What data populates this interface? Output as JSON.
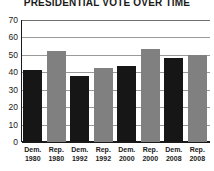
{
  "chart_data": {
    "type": "bar",
    "title": "PRESIDENTIAL VOTE OVER TIME",
    "subtitle": "",
    "xlabel": "",
    "ylabel": "",
    "ylim": [
      0,
      70
    ],
    "yticks": [
      0,
      10,
      20,
      30,
      40,
      50,
      60,
      70
    ],
    "grid": true,
    "legend": "none",
    "categories": [
      "Dem. 1980",
      "Rep. 1980",
      "Dem. 1992",
      "Rep. 1992",
      "Dem. 2000",
      "Rep. 2000",
      "Dem. 2008",
      "Rep. 2008"
    ],
    "category_parts": [
      {
        "party": "Dem.",
        "year": "1980"
      },
      {
        "party": "Rep.",
        "year": "1980"
      },
      {
        "party": "Dem.",
        "year": "1992"
      },
      {
        "party": "Rep.",
        "year": "1992"
      },
      {
        "party": "Dem.",
        "year": "2000"
      },
      {
        "party": "Rep.",
        "year": "2000"
      },
      {
        "party": "Dem.",
        "year": "2008"
      },
      {
        "party": "Rep.",
        "year": "2008"
      }
    ],
    "values": [
      41.5,
      52,
      38,
      42.5,
      43.5,
      53.5,
      48,
      50
    ],
    "bar_colors": [
      "#161616",
      "#808080",
      "#161616",
      "#808080",
      "#161616",
      "#808080",
      "#161616",
      "#808080"
    ],
    "colors": {
      "democrat": "#161616",
      "republican": "#808080",
      "axis": "#1a1a1a",
      "gridline": "#9a9a9a",
      "background": "#ffffff"
    }
  }
}
